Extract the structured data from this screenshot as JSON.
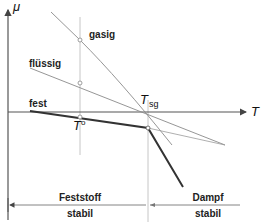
{
  "diagram": {
    "type": "chemical-potential-vs-temperature",
    "axes": {
      "y_label": "μ",
      "x_label": "T"
    },
    "curves": [
      {
        "name": "gasig",
        "label": "gasig",
        "style": "thin"
      },
      {
        "name": "flüssig",
        "label": "flüssig",
        "style": "thin"
      },
      {
        "name": "fest",
        "label": "fest",
        "style": "thick"
      }
    ],
    "markers": {
      "t_zero": {
        "label": "T",
        "superscript": "o"
      },
      "t_sg": {
        "label": "T",
        "subscript": "sg"
      }
    },
    "regions": [
      {
        "name": "solid-stable",
        "line1": "Feststoff",
        "line2": "stabil"
      },
      {
        "name": "vapor-stable",
        "line1": "Dampf",
        "line2": "stabil"
      }
    ],
    "colors": {
      "thin_line": "#8a8a8a",
      "thick_line": "#333333",
      "axis": "#555555",
      "guide": "#b0b0b0"
    }
  }
}
